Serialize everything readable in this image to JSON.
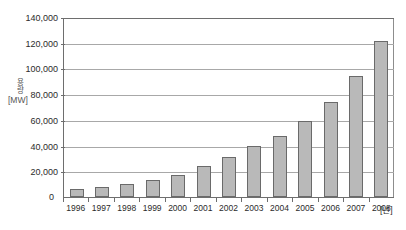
{
  "chart_data": {
    "type": "bar",
    "title": "",
    "subtitle": "",
    "xlabel": "[년]",
    "ylabel_vertical": "용량",
    "ylabel_unit": "[MW]",
    "categories": [
      "1996",
      "1997",
      "1998",
      "1999",
      "2000",
      "2001",
      "2002",
      "2003",
      "2004",
      "2005",
      "2006",
      "2007",
      "2008"
    ],
    "values": [
      6100,
      7600,
      10200,
      13600,
      17400,
      23900,
      31100,
      39400,
      47600,
      59000,
      74000,
      94000,
      121000
    ],
    "ylim": [
      0,
      140000
    ],
    "ytick_values": [
      0,
      20000,
      40000,
      60000,
      80000,
      100000,
      120000,
      140000
    ],
    "ytick_labels": [
      "0",
      "20,000",
      "40,000",
      "60,000",
      "80,000",
      "100,000",
      "120,000",
      "140,000"
    ],
    "grid": true,
    "legend": false,
    "legend_position": "none",
    "series_name": "",
    "bar_fill_color": "#b9b9b9",
    "bar_border_color": "#6a6a6a",
    "gridline_color": "#a8a8a8",
    "axis_color": "#6e6e6e",
    "background_color": "#ffffff"
  }
}
